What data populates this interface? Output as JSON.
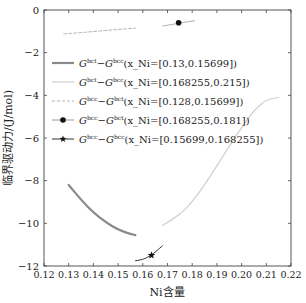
{
  "chart_data": {
    "type": "line",
    "title": "",
    "xlabel": "Ni含量",
    "ylabel": "临界驱动力/(J/mol)",
    "xlim": [
      0.12,
      0.22
    ],
    "ylim": [
      -12,
      0
    ],
    "xticks": [
      "0.12",
      "0.13",
      "0.14",
      "0.15",
      "0.16",
      "0.17",
      "0.18",
      "0.19",
      "0.20",
      "0.21",
      "0.22"
    ],
    "yticks": [
      "0",
      "−2",
      "−4",
      "−6",
      "−8",
      "−10",
      "−12"
    ],
    "grid": false,
    "legend_position": "upper-left-inside",
    "series": [
      {
        "name": "G^bct−G^bcc(x_Ni=[0.13,0.15699])",
        "legend_label": {
          "g1": "G",
          "s1": "bct",
          "g2": "G",
          "s2": "bcc",
          "range": "(x_Ni=[0.13,0.15699])"
        },
        "style": "solid",
        "color": "#8a8a8a",
        "width": 2.2,
        "marker": "none",
        "x": [
          0.13,
          0.135,
          0.14,
          0.145,
          0.15,
          0.155,
          0.157
        ],
        "y": [
          -8.2,
          -8.9,
          -9.5,
          -9.95,
          -10.3,
          -10.5,
          -10.55
        ]
      },
      {
        "name": "G^bct−G^bcc(x_Ni=[0.168255,0.215])",
        "legend_label": {
          "g1": "G",
          "s1": "bct",
          "g2": "G",
          "s2": "bcc",
          "range": "(x_Ni=[0.168255,0.215])"
        },
        "style": "solid",
        "color": "#cfcfcf",
        "width": 1.2,
        "marker": "none",
        "x": [
          0.168,
          0.175,
          0.18,
          0.185,
          0.19,
          0.195,
          0.2,
          0.205,
          0.21,
          0.215
        ],
        "y": [
          -10.1,
          -9.6,
          -9.0,
          -8.2,
          -7.3,
          -6.4,
          -5.5,
          -4.7,
          -4.2,
          -4.1
        ]
      },
      {
        "name": "G^bcc−G^bct(x_Ni=[0.128,0.15699])",
        "legend_label": {
          "g1": "G",
          "s1": "bcc",
          "g2": "G",
          "s2": "bct",
          "range": "(x_Ni=[0.128,0.15699])"
        },
        "style": "dashed",
        "color": "#b5b5b5",
        "width": 1,
        "marker": "none",
        "x": [
          0.128,
          0.135,
          0.14,
          0.145,
          0.15,
          0.157
        ],
        "y": [
          -1.12,
          -1.06,
          -1.01,
          -0.96,
          -0.91,
          -0.85
        ]
      },
      {
        "name": "G^bcc−G^bct(x_Ni=[0.168255,0.181])",
        "legend_label": {
          "g1": "G",
          "s1": "bcc",
          "g2": "G",
          "s2": "bct",
          "range": "(x_Ni=[0.168255,0.181])"
        },
        "style": "solid",
        "color": "#9a9a9a",
        "width": 0.8,
        "marker": "circle",
        "x": [
          0.168,
          0.181
        ],
        "y": [
          -0.75,
          -0.5
        ],
        "marker_at": {
          "x": 0.1745,
          "y": -0.6
        }
      },
      {
        "name": "G^bcc−G^bcc(x_Ni=[0.15699,0.168255])",
        "legend_label": {
          "g1": "G",
          "s1": "bcc",
          "g2": "G",
          "s2": "bcc",
          "range": "(x_Ni=[0.15699,0.168255])"
        },
        "style": "solid",
        "color": "#333333",
        "width": 1,
        "marker": "star",
        "x": [
          0.157,
          0.159,
          0.161,
          0.163,
          0.165,
          0.167,
          0.168
        ],
        "y": [
          -11.75,
          -11.72,
          -11.65,
          -11.52,
          -11.35,
          -11.15,
          -11.05
        ],
        "marker_at": {
          "x": 0.1635,
          "y": -11.5
        }
      }
    ]
  }
}
